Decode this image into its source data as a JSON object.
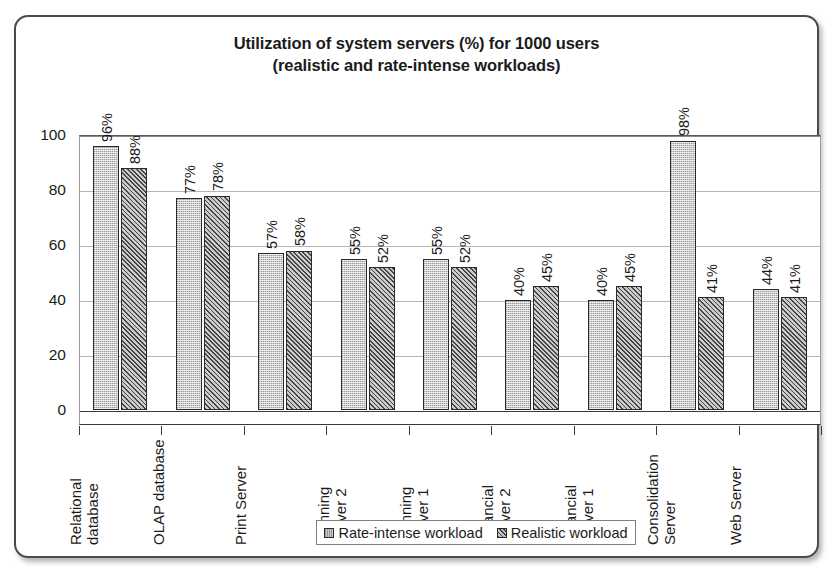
{
  "chart_data": {
    "type": "bar",
    "title": "Utilization of system servers (%) for 1000 users (realistic and rate-intense workloads)",
    "title_line1": "Utilization of system servers (%) for 1000 users",
    "title_line2": "(realistic and rate-intense workloads)",
    "xlabel": "",
    "ylabel": "",
    "ylim": [
      0,
      100
    ],
    "yticks": [
      0,
      20,
      40,
      60,
      80,
      100
    ],
    "ytick_labels": [
      "0",
      "20",
      "40",
      "60",
      "80",
      "100"
    ],
    "grid": true,
    "legend_position": "bottom-center",
    "categories": [
      "Relational\ndatabase",
      "OLAP database",
      "Print Server",
      "Planning\nServer 2",
      "Planning\nServer 1",
      "Financial\nServer 2",
      "Financial\nServer 1",
      "Consolidation\nServer",
      "Web Server"
    ],
    "series": [
      {
        "name": "Rate-intense workload",
        "values": [
          96,
          77,
          57,
          55,
          55,
          40,
          40,
          98,
          44
        ],
        "labels": [
          "96%",
          "77%",
          "57%",
          "55%",
          "55%",
          "40%",
          "40%",
          "98%",
          "44%"
        ],
        "color": "#c9c9c9",
        "pattern": "fine-dots"
      },
      {
        "name": "Realistic workload",
        "values": [
          88,
          78,
          58,
          52,
          52,
          45,
          45,
          41,
          41
        ],
        "labels": [
          "88%",
          "78%",
          "58%",
          "52%",
          "52%",
          "45%",
          "45%",
          "41%",
          "41%"
        ],
        "color": "#8f8f8f",
        "pattern": "diagonal-hatch"
      }
    ]
  },
  "legend": {
    "items": [
      {
        "label": "Rate-intense workload"
      },
      {
        "label": "Realistic workload"
      }
    ]
  },
  "colors": {
    "frame_border": "#4a4a4a",
    "axis": "#3a3a3a",
    "gridline": "#b5b5b5",
    "text": "#1b1b1b",
    "series_rate_intense": "#c9c9c9",
    "series_realistic": "#8f8f8f"
  }
}
